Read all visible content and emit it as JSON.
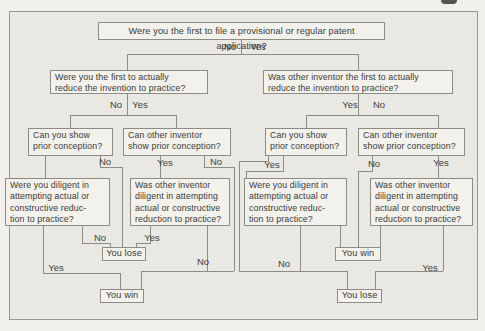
{
  "figure": {
    "type": "decision-tree",
    "frame": {
      "x": 9,
      "y": 11,
      "w": 469,
      "h": 309
    },
    "colors": {
      "page_background": "#f1f0ec",
      "figure_background": "#e9e8e2",
      "box_fill": "#f2f1eb",
      "line": "#8d8c84",
      "text": "#3b3b38"
    },
    "corner_ink_mark": {
      "x": 441,
      "y": 0,
      "w": 16,
      "h": 4
    }
  },
  "flowchart": {
    "nodes": [
      {
        "id": "q-filed-first",
        "text": "Were you the first to file a provisional or regular patent application?",
        "x": 98,
        "y": 22,
        "w": 287,
        "h": 18,
        "cls": "center toprow"
      },
      {
        "id": "q-you-reduced-first",
        "text": "Were you the first to actually\nreduce the invention to practice?",
        "x": 50,
        "y": 70,
        "w": 158,
        "h": 24,
        "cls": ""
      },
      {
        "id": "q-other-reduced-first",
        "text": "Was other inventor the first to actually\nreduce the invention to practice?",
        "x": 263,
        "y": 70,
        "w": 190,
        "h": 24,
        "cls": ""
      },
      {
        "id": "q-you-prior-conception-left",
        "text": "Can you show\nprior conception?",
        "x": 28,
        "y": 128,
        "w": 85,
        "h": 28,
        "cls": ""
      },
      {
        "id": "q-other-prior-conception-left",
        "text": "Can other inventor\nshow prior conception?",
        "x": 123,
        "y": 128,
        "w": 108,
        "h": 28,
        "cls": ""
      },
      {
        "id": "q-you-prior-conception-right",
        "text": "Can you show\nprior conception?",
        "x": 265,
        "y": 128,
        "w": 82,
        "h": 28,
        "cls": ""
      },
      {
        "id": "q-other-prior-conception-right",
        "text": "Can other inventor\nshow prior conception?",
        "x": 358,
        "y": 128,
        "w": 107,
        "h": 28,
        "cls": ""
      },
      {
        "id": "q-you-diligent-left",
        "text": "Were you diligent in\nattempting actual or\nconstructive reduc-\ntion to practice?",
        "x": 5,
        "y": 178,
        "w": 105,
        "h": 48,
        "cls": ""
      },
      {
        "id": "q-other-diligent-left",
        "text": "Was other inventor\ndiligent in attempting\nactual or constructive\nreduction to practice?",
        "x": 130,
        "y": 178,
        "w": 100,
        "h": 48,
        "cls": ""
      },
      {
        "id": "q-you-diligent-right",
        "text": "Were you diligent in\nattempting actual or\nconstructive reduc-\ntion to practice?",
        "x": 244,
        "y": 178,
        "w": 103,
        "h": 48,
        "cls": ""
      },
      {
        "id": "q-other-diligent-right",
        "text": "Was other inventor\ndiligent in attempting\nactual or constructive\nreduction to practice?",
        "x": 370,
        "y": 178,
        "w": 103,
        "h": 48,
        "cls": ""
      },
      {
        "id": "outcome-lose-left",
        "text": "You lose",
        "x": 102,
        "y": 247,
        "w": 44,
        "h": 14,
        "cls": "outcome"
      },
      {
        "id": "outcome-win-left",
        "text": "You win",
        "x": 100,
        "y": 289,
        "w": 44,
        "h": 14,
        "cls": "outcome"
      },
      {
        "id": "outcome-win-right",
        "text": "You win",
        "x": 335,
        "y": 247,
        "w": 46,
        "h": 14,
        "cls": "outcome"
      },
      {
        "id": "outcome-lose-right",
        "text": "You lose",
        "x": 337,
        "y": 289,
        "w": 45,
        "h": 14,
        "cls": "outcome"
      }
    ],
    "edges": [
      {
        "id": "root-drop",
        "points": [
          [
            241,
            40
          ],
          [
            241,
            54
          ]
        ]
      },
      {
        "id": "root-split",
        "points": [
          [
            127,
            70
          ],
          [
            127,
            54
          ],
          [
            358,
            54
          ],
          [
            358,
            70
          ]
        ]
      },
      {
        "id": "left2-drop",
        "points": [
          [
            127,
            94
          ],
          [
            127,
            115
          ]
        ]
      },
      {
        "id": "left2-split",
        "points": [
          [
            70,
            128
          ],
          [
            70,
            115
          ],
          [
            176,
            115
          ],
          [
            176,
            128
          ]
        ]
      },
      {
        "id": "right2-drop",
        "points": [
          [
            358,
            94
          ],
          [
            358,
            115
          ]
        ]
      },
      {
        "id": "right2-split",
        "points": [
          [
            306,
            128
          ],
          [
            306,
            115
          ],
          [
            438,
            115
          ],
          [
            438,
            128
          ]
        ]
      },
      {
        "id": "l3a-yes",
        "points": [
          [
            45,
            156
          ],
          [
            45,
            178
          ]
        ]
      },
      {
        "id": "l3a-no",
        "points": [
          [
            100,
            156
          ],
          [
            100,
            167
          ],
          [
            122,
            167
          ],
          [
            122,
            247
          ]
        ]
      },
      {
        "id": "l3b-yes",
        "points": [
          [
            160,
            156
          ],
          [
            160,
            178
          ]
        ]
      },
      {
        "id": "l3b-no",
        "points": [
          [
            204,
            156
          ],
          [
            204,
            167
          ],
          [
            234,
            167
          ],
          [
            234,
            271
          ]
        ]
      },
      {
        "id": "r3a-yes",
        "points": [
          [
            283,
            156
          ],
          [
            283,
            171
          ],
          [
            246,
            171
          ],
          [
            246,
            178
          ]
        ]
      },
      {
        "id": "r3a-no",
        "points": [
          [
            268,
            156
          ],
          [
            268,
            161
          ],
          [
            239,
            161
          ],
          [
            239,
            271
          ]
        ]
      },
      {
        "id": "r3b-no",
        "points": [
          [
            372,
            156
          ],
          [
            372,
            171
          ],
          [
            358,
            171
          ],
          [
            358,
            247
          ]
        ]
      },
      {
        "id": "r3b-yes",
        "points": [
          [
            438,
            156
          ],
          [
            438,
            178
          ]
        ]
      },
      {
        "id": "l4a-no",
        "points": [
          [
            82,
            226
          ],
          [
            82,
            243
          ],
          [
            110,
            243
          ],
          [
            110,
            247
          ]
        ]
      },
      {
        "id": "l4b-yes",
        "points": [
          [
            150,
            226
          ],
          [
            150,
            243
          ],
          [
            136,
            243
          ],
          [
            136,
            247
          ]
        ]
      },
      {
        "id": "l4a-yes",
        "points": [
          [
            43,
            226
          ],
          [
            43,
            273
          ]
        ]
      },
      {
        "id": "win-bus-left",
        "points": [
          [
            43,
            273
          ],
          [
            120,
            273
          ],
          [
            120,
            289
          ]
        ]
      },
      {
        "id": "l4b-no",
        "points": [
          [
            207,
            226
          ],
          [
            207,
            271
          ]
        ]
      },
      {
        "id": "win-bus-right",
        "points": [
          [
            141,
            289
          ],
          [
            141,
            271
          ],
          [
            234,
            271
          ]
        ]
      },
      {
        "id": "r4a-no",
        "points": [
          [
            300,
            226
          ],
          [
            300,
            271
          ]
        ]
      },
      {
        "id": "lose-bus-left",
        "points": [
          [
            239,
            271
          ],
          [
            347,
            271
          ],
          [
            347,
            289
          ]
        ]
      },
      {
        "id": "r4a-yes",
        "points": [
          [
            340,
            226
          ],
          [
            340,
            247
          ]
        ]
      },
      {
        "id": "r4b-no",
        "points": [
          [
            380,
            226
          ],
          [
            380,
            247
          ]
        ]
      },
      {
        "id": "r4b-yes",
        "points": [
          [
            443,
            226
          ],
          [
            443,
            271
          ]
        ]
      },
      {
        "id": "lose-bus-right",
        "points": [
          [
            443,
            271
          ],
          [
            375,
            271
          ],
          [
            375,
            289
          ]
        ]
      }
    ],
    "labels": [
      {
        "id": "root-no",
        "text": "No",
        "x": 230,
        "y": 50
      },
      {
        "id": "root-yes",
        "text": "Yes",
        "x": 258,
        "y": 50
      },
      {
        "id": "left2-no",
        "text": "No",
        "x": 116,
        "y": 108
      },
      {
        "id": "left2-yes",
        "text": "Yes",
        "x": 140,
        "y": 108
      },
      {
        "id": "right2-yes",
        "text": "Yes",
        "x": 350,
        "y": 108
      },
      {
        "id": "right2-no",
        "text": "No",
        "x": 379,
        "y": 108
      },
      {
        "id": "l3a-no",
        "text": "No",
        "x": 105,
        "y": 165
      },
      {
        "id": "l3b-yes",
        "text": "Yes",
        "x": 165,
        "y": 166
      },
      {
        "id": "l3b-no",
        "text": "No",
        "x": 216,
        "y": 165
      },
      {
        "id": "r3a-yes",
        "text": "Yes",
        "x": 272,
        "y": 168
      },
      {
        "id": "r3b-no",
        "text": "No",
        "x": 374,
        "y": 167
      },
      {
        "id": "r3b-yes",
        "text": "Yes",
        "x": 441,
        "y": 166
      },
      {
        "id": "l4a-no",
        "text": "No",
        "x": 100,
        "y": 241
      },
      {
        "id": "l4b-yes",
        "text": "Yes",
        "x": 152,
        "y": 241
      },
      {
        "id": "l4a-yes",
        "text": "Yes",
        "x": 56,
        "y": 271
      },
      {
        "id": "l4b-no",
        "text": "No",
        "x": 203,
        "y": 265
      },
      {
        "id": "r4a-no",
        "text": "No",
        "x": 284,
        "y": 267
      },
      {
        "id": "r4b-yes",
        "text": "Yes",
        "x": 430,
        "y": 271
      }
    ]
  }
}
